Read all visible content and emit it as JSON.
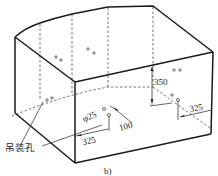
{
  "figure": {
    "caption": "b)",
    "annotations": {
      "lifting_hole_label": "吊装孔",
      "hole_diameter": "φ25",
      "spacing_100": "100",
      "offset_325_front": "325",
      "height_350": "350",
      "offset_325_right": "325"
    }
  }
}
